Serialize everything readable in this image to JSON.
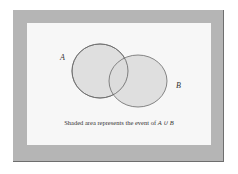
{
  "diagram": {
    "type": "venn",
    "sets": [
      {
        "label": "A",
        "shaded": true
      },
      {
        "label": "B",
        "shaded": true
      }
    ],
    "caption_prefix": "Shaded area represents the event of ",
    "caption_math": "A ∪ B",
    "colors": {
      "frame": "#b5b5b5",
      "panel": "#f7f7f7",
      "shade": "#dcdcdc",
      "outline": "#6a6a6a"
    }
  }
}
